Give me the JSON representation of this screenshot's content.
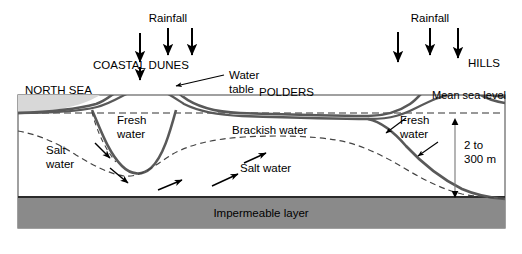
{
  "diagram": {
    "colors": {
      "sea_fill": "#d8d8d8",
      "impermeable_fill": "#8a8a8a",
      "ground_line": "#595959",
      "frame_line": "#6e6e6e",
      "text": "#000000",
      "background": "#ffffff"
    },
    "labels": {
      "rainfall_left": "Rainfall",
      "rainfall_right": "Rainfall",
      "coastal_dunes": "COASTAL DUNES",
      "north_sea": "NORTH SEA",
      "water_table": "Water\ntable",
      "water_table_line1": "Water",
      "water_table_line2": "table",
      "polders": "POLDERS",
      "hills": "HILLS",
      "mean_sea_level": "Mean sea level",
      "fresh_water_left_line1": "Fresh",
      "fresh_water_left_line2": "water",
      "fresh_water_right_line1": "Fresh",
      "fresh_water_right_line2": "water",
      "brackish_water": "Brackish water",
      "salt_water_left_line1": "Salt",
      "salt_water_left_line2": "water",
      "salt_water_middle": "Salt water",
      "depth_line1": "2 to",
      "depth_line2": "300 m",
      "impermeable_layer": "Impermeable layer"
    },
    "annotations": {
      "depth_range_value": "2 to 300 m",
      "rainfall_arrow_count_left": 3,
      "rainfall_arrow_count_right": 3,
      "flow_arrow_count": 5
    }
  }
}
